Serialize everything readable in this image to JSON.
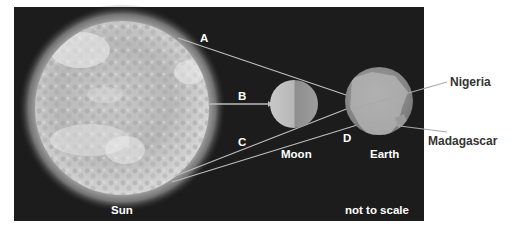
{
  "diagram": {
    "type": "sun-moon-earth-eclipse",
    "bodies": {
      "sun": {
        "label": "Sun"
      },
      "moon": {
        "label": "Moon"
      },
      "earth": {
        "label": "Earth"
      }
    },
    "rays": [
      {
        "label": "A"
      },
      {
        "label": "B"
      },
      {
        "label": "C"
      },
      {
        "label": "D"
      }
    ],
    "callouts": [
      {
        "label": "Nigeria"
      },
      {
        "label": "Madagascar"
      }
    ],
    "note": "not to scale"
  },
  "colors": {
    "background": "#1c1c1c",
    "label_on_dark": "#ffffff",
    "label_on_light": "#333333",
    "ray_line": "#bdbdbd"
  }
}
